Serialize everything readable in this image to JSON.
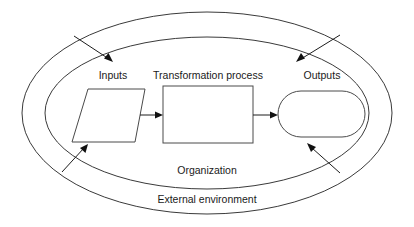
{
  "diagram": {
    "background_color": "#ffffff",
    "line_color": "#3a3a3a",
    "text_color": "#1a1a1a",
    "boundaries": [
      {
        "id": "external-environment",
        "label": "External environment",
        "shape": "ellipse",
        "cx": 207,
        "cy": 113,
        "rx": 185,
        "ry": 101
      },
      {
        "id": "organization",
        "label": "Organization",
        "shape": "ellipse",
        "cx": 207,
        "cy": 113,
        "rx": 162,
        "ry": 76
      }
    ],
    "nodes": [
      {
        "id": "inputs",
        "label": "Inputs",
        "shape": "parallelogram",
        "label_x": 113,
        "label_y": 79
      },
      {
        "id": "transformation-process",
        "label": "Transformation process",
        "shape": "rectangle",
        "label_x": 208,
        "label_y": 79
      },
      {
        "id": "outputs",
        "label": "Outputs",
        "shape": "stadium",
        "label_x": 322,
        "label_y": 79
      }
    ],
    "flow_arrows": [
      {
        "id": "inputs-to-transformation",
        "from": "inputs",
        "to": "transformation-process"
      },
      {
        "id": "transformation-to-outputs",
        "from": "transformation-process",
        "to": "outputs"
      }
    ],
    "environment_arrows": [
      {
        "id": "env-arrow-top-left",
        "direction": "down-right",
        "points_to": "inputs"
      },
      {
        "id": "env-arrow-top-right",
        "direction": "down-left",
        "points_to": "outputs"
      },
      {
        "id": "env-arrow-bottom-left",
        "direction": "up-right",
        "points_to": "inputs"
      },
      {
        "id": "env-arrow-bottom-right",
        "direction": "up-left",
        "points_to": "outputs"
      }
    ],
    "caption_labels": {
      "organization": "Organization",
      "organization_x": 207,
      "organization_y": 174,
      "external_environment": "External environment",
      "external_environment_x": 207,
      "external_environment_y": 203
    }
  }
}
